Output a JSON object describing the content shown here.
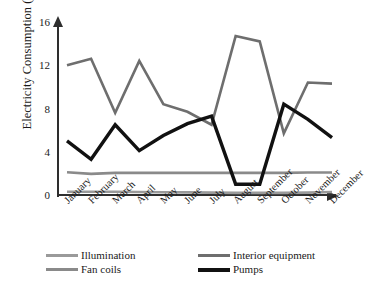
{
  "chart_data": {
    "type": "line",
    "title": "",
    "xlabel": "",
    "ylabel": "Electricity Consumption (GJ)",
    "categories": [
      "January",
      "February",
      "March",
      "April",
      "May",
      "June",
      "July",
      "August",
      "September",
      "October",
      "November",
      "December"
    ],
    "yticks": [
      0,
      4,
      8,
      12,
      16
    ],
    "ylim": [
      0,
      16
    ],
    "grid": false,
    "legend_position": "bottom",
    "series": [
      {
        "name": "Illumination",
        "color": "#9a9a9a",
        "width": 2.6,
        "values": [
          0.3,
          0.3,
          0.3,
          0.28,
          0.26,
          0.24,
          0.22,
          0.2,
          0.2,
          0.2,
          0.22,
          0.28
        ]
      },
      {
        "name": "Interior equipment",
        "color": "#6e6e6e",
        "width": 2.6,
        "values": [
          12.0,
          12.6,
          7.6,
          12.4,
          8.4,
          7.7,
          6.5,
          14.7,
          14.2,
          5.7,
          10.4,
          10.3
        ]
      },
      {
        "name": "Fan coils",
        "color": "#8a8a8a",
        "width": 2.6,
        "values": [
          2.1,
          1.95,
          2.05,
          2.05,
          2.05,
          2.05,
          2.05,
          2.05,
          2.05,
          2.05,
          2.08,
          2.08
        ]
      },
      {
        "name": "Pumps",
        "color": "#111111",
        "width": 3.4,
        "values": [
          5.0,
          3.3,
          6.5,
          4.1,
          5.5,
          6.6,
          7.3,
          1.0,
          1.0,
          8.4,
          7.0,
          5.3
        ]
      }
    ]
  },
  "legend": {
    "items": [
      {
        "label": "Illumination",
        "color": "#9a9a9a",
        "thickness": "2.8px"
      },
      {
        "label": "Interior equipment",
        "color": "#6e6e6e",
        "thickness": "3px"
      },
      {
        "label": "Fan coils",
        "color": "#8a8a8a",
        "thickness": "3.2px"
      },
      {
        "label": "Pumps",
        "color": "#111111",
        "thickness": "4px"
      }
    ]
  },
  "caption": ""
}
